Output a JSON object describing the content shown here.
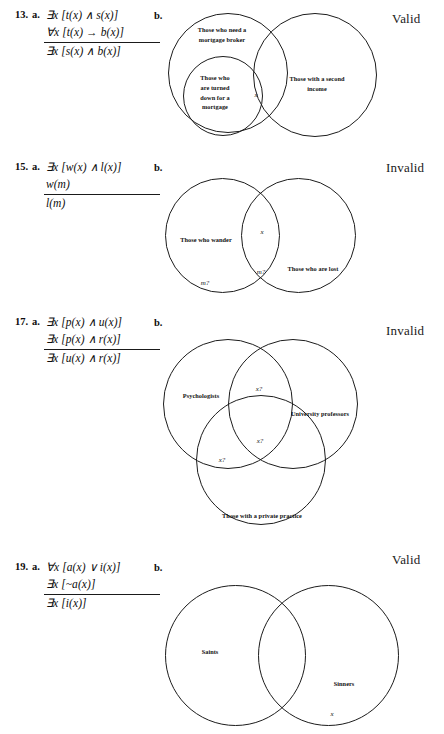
{
  "problems": [
    {
      "number": "13.",
      "part_a_label": "a.",
      "part_b_label": "b.",
      "premises": [
        "∃x [t(x) ∧ s(x)]",
        "∀x [t(x) → b(x)]"
      ],
      "conclusion": "∃x [s(x) ∧ b(x)]",
      "verdict": "Valid",
      "diagram": {
        "type": "venn-nested-overlap",
        "circles": [
          {
            "name": "need-mortgage-broker",
            "label": "Those who need a\nmortgage broker"
          },
          {
            "name": "turned-down-for-mortgage",
            "label": "Those who\nare turned\ndown for a\nmortgage"
          },
          {
            "name": "second-income",
            "label": "Those with a second\nincome"
          }
        ],
        "marks": [
          {
            "name": "x-mark",
            "text": "x"
          }
        ]
      }
    },
    {
      "number": "15.",
      "part_a_label": "a.",
      "part_b_label": "b.",
      "premises": [
        "∃x [w(x) ∧ l(x)]",
        "w(m)"
      ],
      "conclusion": "l(m)",
      "verdict": "Invalid",
      "diagram": {
        "type": "venn-two-circle",
        "circles": [
          {
            "name": "those-who-wander",
            "label": "Those who wander"
          },
          {
            "name": "those-who-are-lost",
            "label": "Those who are lost"
          }
        ],
        "marks": [
          {
            "name": "x-mark",
            "text": "x"
          },
          {
            "name": "m-question-overlap",
            "text": "m?"
          },
          {
            "name": "m-question-left",
            "text": "m?"
          }
        ]
      }
    },
    {
      "number": "17.",
      "part_a_label": "a.",
      "part_b_label": "b.",
      "premises": [
        "∃x [p(x) ∧ u(x)]",
        "∃x [p(x) ∧ r(x)]"
      ],
      "conclusion": "∃x [u(x) ∧ r(x)]",
      "verdict": "Invalid",
      "diagram": {
        "type": "venn-three-circle",
        "circles": [
          {
            "name": "psychologists",
            "label": "Psychologists"
          },
          {
            "name": "university-professors",
            "label": "University professors"
          },
          {
            "name": "private-practice",
            "label": "Those with a private practice"
          }
        ],
        "marks": [
          {
            "name": "x-question-top",
            "text": "x?"
          },
          {
            "name": "x-question-center",
            "text": "x?"
          },
          {
            "name": "x-question-left",
            "text": "x?"
          }
        ]
      }
    },
    {
      "number": "19.",
      "part_a_label": "a.",
      "part_b_label": "b.",
      "premises": [
        "∀x [a(x) ∨ i(x)]",
        "∃x [~a(x)]"
      ],
      "conclusion": "∃x [i(x)]",
      "verdict": "Valid",
      "diagram": {
        "type": "venn-two-circle",
        "circles": [
          {
            "name": "saints",
            "label": "Saints"
          },
          {
            "name": "sinners",
            "label": "Sinners"
          }
        ],
        "marks": [
          {
            "name": "x-mark",
            "text": "x"
          }
        ]
      }
    }
  ]
}
